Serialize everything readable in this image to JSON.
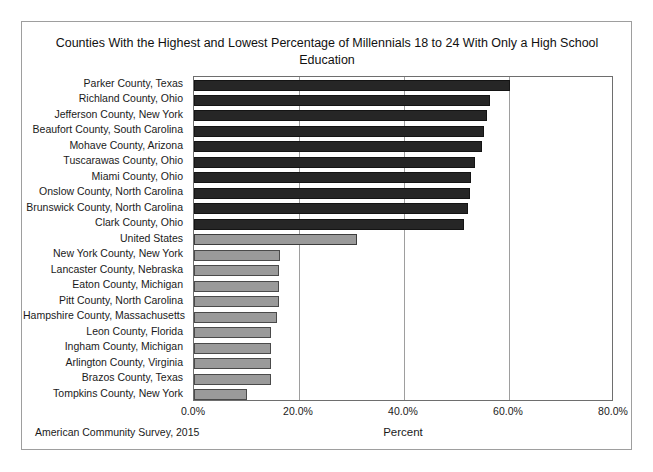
{
  "figure": {
    "title": "Counties With the Highest and Lowest Percentage of Millennials 18 to 24 With Only a High School Education",
    "source_note": "American Community Survey, 2015",
    "x_axis_title": "Percent"
  },
  "colors": {
    "high_bar": "#262626",
    "low_bar": "#9a9a9a",
    "us_bar": "#9a9a9a",
    "frame": "#6e6e6e",
    "gridline": "#9e9e9e",
    "page_border": "#9e9e9e",
    "background": "#ffffff"
  },
  "chart_data": {
    "type": "bar",
    "orientation": "horizontal",
    "title": "Counties With the Highest and Lowest Percentage of Millennials 18 to 24 With Only a High School Education",
    "xlabel": "Percent",
    "ylabel": "",
    "xlim": [
      0,
      80
    ],
    "xticks": [
      0,
      20,
      40,
      60,
      80
    ],
    "xtick_labels": [
      "0.0%",
      "20.0%",
      "40.0%",
      "60.0%",
      "80.0%"
    ],
    "grid": true,
    "grid_axis": "x",
    "legend": false,
    "value_unit": "percent",
    "categories": [
      "Parker County, Texas",
      "Richland County, Ohio",
      "Jefferson County, New York",
      "Beaufort County, South Carolina",
      "Mohave County, Arizona",
      "Tuscarawas County, Ohio",
      "Miami County, Ohio",
      "Onslow County, North Carolina",
      "Brunswick County, North Carolina",
      "Clark County, Ohio",
      "United States",
      "New York County, New York",
      "Lancaster County, Nebraska",
      "Eaton County, Michigan",
      "Pitt County, North Carolina",
      "Hampshire County, Massachusetts",
      "Leon County, Florida",
      "Ingham County, Michigan",
      "Arlington County, Virginia",
      "Brazos County, Texas",
      "Tompkins County, New York"
    ],
    "values": [
      60.1,
      56.4,
      55.8,
      55.2,
      54.8,
      53.5,
      52.8,
      52.6,
      52.2,
      51.4,
      31.0,
      16.4,
      16.2,
      16.2,
      16.1,
      15.8,
      14.7,
      14.7,
      14.7,
      14.6,
      10.1
    ],
    "groups": [
      "high",
      "high",
      "high",
      "high",
      "high",
      "high",
      "high",
      "high",
      "high",
      "high",
      "us",
      "low",
      "low",
      "low",
      "low",
      "low",
      "low",
      "low",
      "low",
      "low",
      "low"
    ]
  }
}
